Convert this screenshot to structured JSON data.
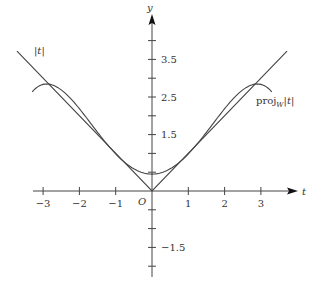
{
  "chart_data": {
    "type": "line",
    "title": "",
    "xlabel": "t",
    "ylabel": "y",
    "origin_label": "O",
    "x_ticks": [
      -3,
      -2,
      -1,
      1,
      2,
      3
    ],
    "x_tick_labels": [
      "−3",
      "−2",
      "−1",
      "1",
      "2",
      "3"
    ],
    "y_ticks": [
      -2,
      -1.5,
      -1,
      -0.5,
      0.5,
      1,
      1.5,
      2,
      2.5,
      3,
      3.5,
      4
    ],
    "y_tick_labels": [
      {
        "value": 3.5,
        "label": "3.5"
      },
      {
        "value": 2.5,
        "label": "2.5"
      },
      {
        "value": 1.5,
        "label": "1.5"
      },
      {
        "value": -1.5,
        "label": "−1.5"
      }
    ],
    "xlim": [
      -3.75,
      3.95
    ],
    "ylim": [
      -2.1,
      4.9
    ],
    "grid": false,
    "series": [
      {
        "name": "|t|",
        "label": "|t|",
        "kind": "abs",
        "t_range": [
          -3.72,
          3.72
        ],
        "points": [
          [
            -3.72,
            3.72
          ],
          [
            0,
            0
          ],
          [
            3.72,
            3.72
          ]
        ]
      },
      {
        "name": "proj_W |t|",
        "label": "proj",
        "label_sub": "W",
        "label_tail": "|t|",
        "kind": "polynomial",
        "coefficients": {
          "c0": 0.45,
          "c2": 0.57,
          "c4": -0.0339
        },
        "t_range": [
          -3.3,
          3.3
        ],
        "points": [
          [
            -3.3,
            2.73
          ],
          [
            -2.9,
            2.85
          ],
          [
            -2,
            2.19
          ],
          [
            -1.5,
            1.56
          ],
          [
            -1,
            0.99
          ],
          [
            0,
            0.45
          ],
          [
            1,
            0.99
          ],
          [
            1.5,
            1.56
          ],
          [
            2,
            2.19
          ],
          [
            2.9,
            2.85
          ],
          [
            3.3,
            2.73
          ]
        ]
      }
    ],
    "annotations": [
      {
        "text": "|t|",
        "near": "upper-left line"
      },
      {
        "text": "proj_W|t|",
        "near": "right curve"
      }
    ]
  },
  "layout": {
    "origin_px": [
      152,
      191
    ],
    "x_scale_px": 36.3,
    "y_scale_px": 37.6,
    "stroke": "#444444",
    "text_color": "#333333"
  }
}
